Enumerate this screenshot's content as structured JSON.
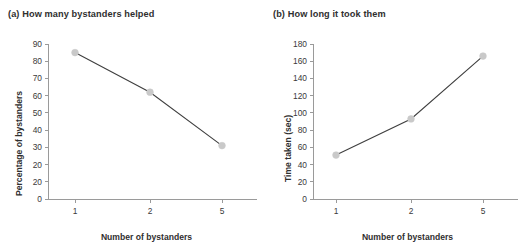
{
  "figure": {
    "background": "#ffffff",
    "line_color": "#3f3f3f",
    "marker_color": "#c9c9c9",
    "axis_color": "#9a9a9a",
    "text_color": "#3a3a3a"
  },
  "chart_data": [
    {
      "type": "line",
      "panel": "(a)",
      "title": "(a) How many bystanders helped",
      "xlabel": "Number of bystanders",
      "ylabel": "Percentage of bystanders",
      "categories": [
        "1",
        "2",
        "5"
      ],
      "values": [
        85,
        62,
        31
      ],
      "xticks": [
        "1",
        "2",
        "5"
      ],
      "yticks": [
        "0",
        "20",
        "20",
        "30",
        "40",
        "50",
        "60",
        "70",
        "80",
        "90"
      ],
      "ytick_values": [
        0,
        10,
        20,
        30,
        40,
        50,
        60,
        70,
        80,
        90
      ],
      "ylim": [
        0,
        90
      ],
      "grid": false,
      "legend": false,
      "markers": "circle"
    },
    {
      "type": "line",
      "panel": "(b)",
      "title": "(b) How long it took them",
      "xlabel": "Number of bystanders",
      "ylabel": "Time taken (sec)",
      "categories": [
        "1",
        "2",
        "5"
      ],
      "values": [
        51,
        93,
        166
      ],
      "xticks": [
        "1",
        "2",
        "5"
      ],
      "yticks": [
        "0",
        "20",
        "40",
        "60",
        "80",
        "100",
        "120",
        "140",
        "160",
        "180"
      ],
      "ytick_values": [
        0,
        20,
        40,
        60,
        80,
        100,
        120,
        140,
        160,
        180
      ],
      "ylim": [
        0,
        180
      ],
      "grid": false,
      "legend": false,
      "markers": "circle"
    }
  ]
}
